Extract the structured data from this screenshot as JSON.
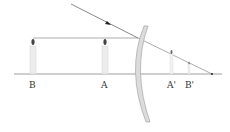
{
  "diagram": {
    "type": "optics-concave-lens-ray-diagram",
    "labels": {
      "B": "B",
      "A": "A",
      "A_prime": "A'",
      "B_prime": "B'"
    },
    "colors": {
      "line": "#666666",
      "lens": "#9a9a9a",
      "candle": "#e8e8e8"
    }
  }
}
